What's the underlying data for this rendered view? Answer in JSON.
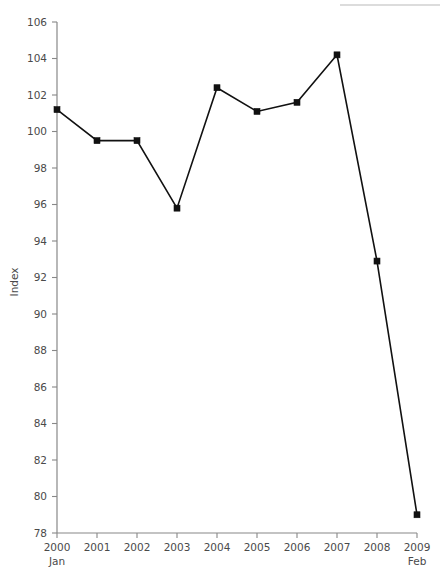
{
  "chart_data": {
    "type": "line",
    "title": "",
    "subtitle": "",
    "xlabel": "",
    "ylabel": "Index",
    "x": [
      "2000",
      "2001",
      "2002",
      "2003",
      "2004",
      "2005",
      "2006",
      "2007",
      "2008",
      "2009"
    ],
    "x_sublabels": {
      "2000": "Jan",
      "2009": "Feb"
    },
    "categories": [
      "2000",
      "2001",
      "2002",
      "2003",
      "2004",
      "2005",
      "2006",
      "2007",
      "2008",
      "2009"
    ],
    "values": [
      101.2,
      99.5,
      99.5,
      95.8,
      102.4,
      101.1,
      101.6,
      104.2,
      92.9,
      79.0
    ],
    "series": [
      {
        "name": "Index",
        "values": [
          101.2,
          99.5,
          99.5,
          95.8,
          102.4,
          101.1,
          101.6,
          104.2,
          92.9,
          79.0
        ]
      }
    ],
    "ylim": [
      78,
      106
    ],
    "yticks": [
      78,
      80,
      82,
      84,
      86,
      88,
      90,
      92,
      94,
      96,
      98,
      100,
      102,
      104,
      106
    ],
    "ytick_labels": [
      "78",
      "80",
      "82",
      "84",
      "86",
      "88",
      "90",
      "92",
      "94",
      "96",
      "98",
      "100",
      "102",
      "104",
      "106"
    ],
    "grid": false,
    "legend": "none",
    "marker": "square",
    "line_color": "#111111",
    "marker_color": "#111111",
    "axis_color": "#888888",
    "background_color": "#ffffff"
  },
  "decor": {
    "top_rule_color": "#dcdcdc"
  }
}
